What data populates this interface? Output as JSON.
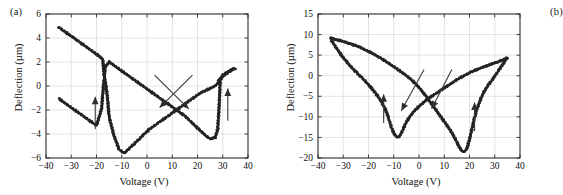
{
  "figure": {
    "panels": [
      {
        "tag": "(a)",
        "xlabel": "Voltage (V)",
        "ylabel": "Deflection (µm)",
        "xticks": [
          "-40",
          "-30",
          "-20",
          "-10",
          "0",
          "10",
          "20",
          "30",
          "40"
        ],
        "yticks": [
          "-6",
          "-4",
          "-2",
          "0",
          "2",
          "4",
          "6"
        ]
      },
      {
        "tag": "(b)",
        "xlabel": "Voltage (V)",
        "ylabel": "Deflection (µm)",
        "xticks": [
          "-40",
          "-30",
          "-20",
          "-10",
          "0",
          "10",
          "20",
          "30",
          "40"
        ],
        "yticks": [
          "-20",
          "-15",
          "-10",
          "-5",
          "0",
          "5",
          "10",
          "15"
        ]
      }
    ]
  },
  "chart_data": [
    {
      "type": "scatter",
      "title": "(a)",
      "xlabel": "Voltage (V)",
      "ylabel": "Deflection (µm)",
      "xlim": [
        -40,
        40
      ],
      "ylim": [
        -6,
        6
      ],
      "xticks": [
        -40,
        -30,
        -20,
        -10,
        0,
        10,
        20,
        30,
        40
      ],
      "yticks": [
        -6,
        -4,
        -2,
        0,
        2,
        4,
        6
      ],
      "grid": true,
      "legend": "none",
      "marker_color": "#232323",
      "annotations": [
        {
          "kind": "arrow",
          "label": "up-arrow-left",
          "x": -20.5,
          "y_from": -3.6,
          "y_to": -0.9,
          "direction": "up"
        },
        {
          "kind": "arrow",
          "label": "up-arrow-right",
          "x": 32.0,
          "y_from": -2.9,
          "y_to": -0.2,
          "direction": "up"
        },
        {
          "kind": "arrow",
          "label": "diagonal-arrow-down-left",
          "x_from": 18.0,
          "y_from": 0.9,
          "x_to": 5.0,
          "y_to": -1.8,
          "direction": "down-left"
        },
        {
          "kind": "arrow",
          "label": "diagonal-arrow-down-right",
          "x_from": 3.0,
          "y_from": 0.9,
          "x_to": 16.5,
          "y_to": -1.9,
          "direction": "down-right"
        }
      ],
      "series": [
        {
          "name": "descending-branch",
          "comment": "Voltage swept from -35 V up to +35 V: deflection falls linearly then snaps.",
          "x": [
            -35,
            -33,
            -31,
            -29,
            -27,
            -25,
            -23,
            -21,
            -19,
            -17.5,
            -17,
            -16,
            -15.5,
            -15,
            -13,
            -11,
            -9,
            -7,
            -5,
            -3,
            -1,
            1,
            3,
            5,
            7,
            9,
            11,
            13,
            15,
            17,
            19,
            21,
            23,
            25,
            27,
            28,
            28.5,
            30,
            32,
            34,
            35
          ],
          "y": [
            4.9,
            4.6,
            4.3,
            4.0,
            3.7,
            3.4,
            3.1,
            2.8,
            2.5,
            2.2,
            0.9,
            -0.3,
            -1.4,
            -2.6,
            -4.2,
            -5.3,
            -5.6,
            -5.2,
            -4.8,
            -4.4,
            -4.0,
            -3.6,
            -3.3,
            -3.0,
            -2.7,
            -2.4,
            -2.1,
            -1.8,
            -1.5,
            -1.2,
            -0.9,
            -0.6,
            -0.4,
            -0.2,
            0.0,
            0.2,
            0.5,
            0.8,
            1.1,
            1.4,
            1.5
          ]
        },
        {
          "name": "ascending-branch",
          "comment": "Voltage swept from +35 V back to -35 V: mirror-image butterfly wing.",
          "x": [
            35,
            34,
            32,
            30,
            29,
            28.5,
            28,
            27,
            25,
            23,
            21,
            19,
            17,
            15,
            13,
            11,
            9,
            7,
            5,
            3,
            1,
            -1,
            -3,
            -5,
            -7,
            -9,
            -11,
            -13,
            -15,
            -16.5,
            -17,
            -17.5,
            -18,
            -20,
            -22,
            -24,
            -26,
            -28,
            -30,
            -32,
            -34,
            -35
          ],
          "y": [
            1.45,
            1.4,
            1.2,
            0.9,
            0.4,
            -2.0,
            -3.6,
            -4.3,
            -4.4,
            -4.1,
            -3.7,
            -3.3,
            -2.9,
            -2.5,
            -2.2,
            -1.9,
            -1.6,
            -1.3,
            -1.0,
            -0.7,
            -0.4,
            -0.1,
            0.2,
            0.5,
            0.8,
            1.1,
            1.4,
            1.7,
            2.0,
            1.6,
            0.6,
            -0.6,
            -1.9,
            -3.3,
            -3.0,
            -2.7,
            -2.4,
            -2.1,
            -1.8,
            -1.5,
            -1.2,
            -1.0
          ]
        }
      ]
    },
    {
      "type": "scatter",
      "title": "(b)",
      "xlabel": "Voltage (V)",
      "ylabel": "Deflection (µm)",
      "xlim": [
        -40,
        40
      ],
      "ylim": [
        -20,
        15
      ],
      "xticks": [
        -40,
        -30,
        -20,
        -10,
        0,
        10,
        20,
        30,
        40
      ],
      "yticks": [
        -20,
        -15,
        -10,
        -5,
        0,
        5,
        10,
        15
      ],
      "grid": true,
      "legend": "none",
      "marker_color": "#232323",
      "annotations": [
        {
          "kind": "arrow",
          "label": "up-arrow-left",
          "x": -14.0,
          "y_from": -11.5,
          "y_to": -4.5,
          "direction": "up"
        },
        {
          "kind": "arrow",
          "label": "up-arrow-right",
          "x": 22.0,
          "y_from": -13.5,
          "y_to": -6.5,
          "direction": "up"
        },
        {
          "kind": "arrow",
          "label": "diagonal-arrow-down-left",
          "x_from": 2.0,
          "y_from": 1.5,
          "x_to": -7.0,
          "y_to": -8.5,
          "direction": "down-left"
        },
        {
          "kind": "arrow",
          "label": "diagonal-arrow-down-right",
          "x_from": 13.0,
          "y_from": 1.5,
          "x_to": 5.0,
          "y_to": -8.0,
          "direction": "down-right"
        }
      ],
      "series": [
        {
          "name": "descending-branch",
          "comment": "Sweep -35 V to +35 V: dips to minimum near +17 V at -18.5 µm.",
          "x": [
            -35,
            -33,
            -31,
            -29,
            -27,
            -25,
            -23,
            -21,
            -19,
            -17,
            -15,
            -13,
            -11,
            -9,
            -7,
            -5,
            -3,
            -1,
            1,
            3,
            5,
            7,
            9,
            11,
            13,
            15,
            16,
            17,
            18,
            19,
            20,
            21,
            22,
            23,
            25,
            27,
            29,
            31,
            33,
            35
          ],
          "y": [
            9.2,
            8.8,
            8.5,
            8.1,
            7.7,
            7.3,
            6.8,
            6.2,
            5.6,
            4.9,
            4.2,
            3.4,
            2.6,
            1.8,
            0.9,
            0.0,
            -1.0,
            -2.2,
            -3.6,
            -5.2,
            -6.9,
            -8.6,
            -10.3,
            -12.0,
            -13.8,
            -16.2,
            -17.4,
            -18.3,
            -18.5,
            -17.6,
            -15.5,
            -12.8,
            -10.2,
            -8.0,
            -4.8,
            -2.6,
            -1.0,
            0.8,
            2.6,
            4.5
          ]
        },
        {
          "name": "ascending-branch",
          "comment": "Sweep +35 V back to -35 V: dips to minimum near -8 V at -15 µm.",
          "x": [
            35,
            33,
            31,
            29,
            27,
            25,
            23,
            21,
            19,
            17,
            15,
            13,
            11,
            9,
            7,
            5,
            3,
            1,
            -1,
            -3,
            -5,
            -6,
            -7,
            -8,
            -9,
            -10,
            -11,
            -12,
            -13,
            -15,
            -17,
            -19,
            -21,
            -23,
            -25,
            -27,
            -29,
            -31,
            -33,
            -35
          ],
          "y": [
            4.3,
            3.8,
            3.3,
            2.9,
            2.4,
            2.0,
            1.5,
            1.0,
            0.4,
            -0.3,
            -1.0,
            -1.8,
            -2.6,
            -3.4,
            -4.2,
            -5.0,
            -5.9,
            -6.9,
            -8.0,
            -9.4,
            -11.2,
            -12.6,
            -14.0,
            -14.9,
            -14.8,
            -14.0,
            -12.4,
            -10.4,
            -8.6,
            -6.2,
            -4.4,
            -2.9,
            -1.5,
            -0.3,
            0.9,
            2.2,
            3.6,
            5.2,
            7.0,
            8.9
          ]
        }
      ]
    }
  ]
}
